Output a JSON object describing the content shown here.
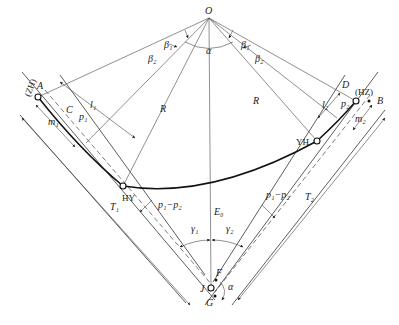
{
  "diagram": {
    "labels": {
      "center": "O",
      "central_angle": "α",
      "beta1_left": "β₁",
      "beta2_left": "β₂",
      "beta1_right": "β₁",
      "beta2_right": "β₂",
      "radius_left": "R",
      "radius_right": "R",
      "point_A": "A",
      "point_ZH": "(ZH)",
      "point_C": "C",
      "p1": "p₁",
      "l1": "l₁",
      "m1": "m₁",
      "point_HY": "HY",
      "p1_minus_p2_left": "p₁−p₂",
      "T1": "T₁",
      "gamma1": "γ₁",
      "E0": "E₀",
      "gamma2": "γ₂",
      "p1_minus_p2_right": "p₁−p₂",
      "T2": "T₂",
      "point_F": "F",
      "point_J": "J",
      "point_G": "G",
      "deflection_alpha": "α",
      "point_YH": "YH",
      "l2": "l₂",
      "point_D": "D",
      "p2": "p₂",
      "point_HZ": "(HZ)",
      "m2": "m₂",
      "point_B": "B"
    },
    "colors": {
      "line": "#333333",
      "curve": "#111111",
      "background": "#ffffff"
    }
  }
}
